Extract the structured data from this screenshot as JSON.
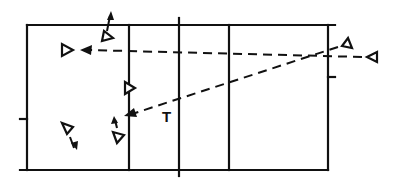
{
  "diagram": {
    "type": "court-play-diagram",
    "colors": {
      "line": "#111111",
      "background": "#ffffff"
    },
    "court": {
      "outer": {
        "left": 27,
        "top": 25,
        "right": 328,
        "bottom": 170
      },
      "dividers_x": [
        129,
        179,
        229
      ]
    },
    "labels": {
      "ball_target": "T"
    },
    "players": [
      {
        "id": "p1",
        "x": 68,
        "y": 50,
        "facing": "right"
      },
      {
        "id": "p2",
        "x": 108,
        "y": 36,
        "facing": "right",
        "move": "up"
      },
      {
        "id": "p3",
        "x": 128,
        "y": 88,
        "facing": "right"
      },
      {
        "id": "p4",
        "x": 67,
        "y": 130,
        "facing": "right",
        "move": "down"
      },
      {
        "id": "p5",
        "x": 118,
        "y": 136,
        "facing": "right",
        "move": "up"
      },
      {
        "id": "p6",
        "x": 348,
        "y": 43,
        "facing": "left"
      },
      {
        "id": "p7",
        "x": 372,
        "y": 57,
        "facing": "left"
      }
    ],
    "passes": [
      {
        "from": "p7",
        "to": "p1",
        "style": "dashed"
      },
      {
        "from": "p6",
        "to": "T",
        "style": "dashed"
      }
    ]
  }
}
